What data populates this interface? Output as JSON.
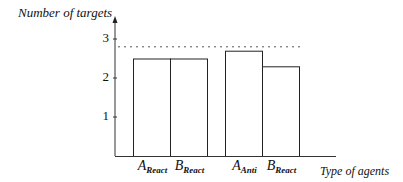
{
  "chart_data": {
    "type": "bar",
    "title": "",
    "ylabel": "Number of targets",
    "xlabel": "Type of agents",
    "categories": [
      {
        "main": "A",
        "sub": "React"
      },
      {
        "main": "B",
        "sub": "React"
      },
      {
        "main": "A",
        "sub": "Anti"
      },
      {
        "main": "B",
        "sub": "React"
      }
    ],
    "category_labels": [
      "A_React",
      "B_React",
      "A_Anti",
      "B_React"
    ],
    "values": [
      2.5,
      2.5,
      2.7,
      2.3
    ],
    "groups": [
      [
        0,
        1
      ],
      [
        2,
        3
      ]
    ],
    "reference_line": {
      "value": 2.8,
      "style": "dotted"
    },
    "yticks": [
      1,
      2,
      3
    ],
    "ylim": [
      0,
      3.5
    ],
    "grid": false,
    "legend": null,
    "bar_fill": "#ffffff",
    "bar_stroke": "#222222"
  }
}
